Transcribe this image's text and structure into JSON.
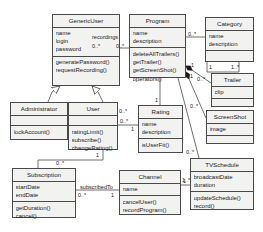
{
  "diagram": {
    "type": "uml-class-diagram",
    "background": "#ffffff",
    "box_fill": "#f2f2f0",
    "line_color": "#4a4a4a"
  },
  "classes": [
    {
      "id": "generic-user",
      "name": "GenericUser",
      "attributes": [
        "name",
        "login",
        "password"
      ],
      "operations": [
        "generatePassword()",
        "requestRecording()"
      ]
    },
    {
      "id": "program",
      "name": "Program",
      "attributes": [
        "name",
        "description"
      ],
      "operations": [
        "deleteAllTrailers()",
        "getTrailer()",
        "getScreenShot()",
        "operators()"
      ]
    },
    {
      "id": "category",
      "name": "Category",
      "attributes": [
        "name",
        "description"
      ],
      "operations": []
    },
    {
      "id": "trailer",
      "name": "Trailer",
      "attributes": [
        "clip"
      ],
      "operations": []
    },
    {
      "id": "screenshot",
      "name": "ScreenShot",
      "attributes": [
        "image"
      ],
      "operations": []
    },
    {
      "id": "administrator",
      "name": "Administrator",
      "attributes": [],
      "operations": [
        "lockAccount()"
      ]
    },
    {
      "id": "user",
      "name": "User",
      "attributes": [],
      "operations": [
        "ratingLimit()",
        "subscribe()",
        "changeRating()"
      ]
    },
    {
      "id": "rating",
      "name": "Rating",
      "attributes": [
        "name",
        "description"
      ],
      "operations": [
        "isUserFit()"
      ]
    },
    {
      "id": "tvschedule",
      "name": "TVSchedule",
      "attributes": [
        "broadcastDate",
        "duration"
      ],
      "operations": [
        "updateSchedule()",
        "record()"
      ]
    },
    {
      "id": "subscription",
      "name": "Subscription",
      "attributes": [
        "startDate",
        "endDate"
      ],
      "operations": [
        "getDuration()",
        "cancel()"
      ]
    },
    {
      "id": "channel",
      "name": "Channel",
      "attributes": [
        "name"
      ],
      "operations": [
        "cancelUser()",
        "recordProgram()"
      ]
    }
  ],
  "association_labels": [
    {
      "id": "recordings",
      "text": "recordings"
    },
    {
      "id": "subscribed-to",
      "text": "subscribedTo"
    }
  ],
  "multiplicities": [
    {
      "id": "genericuser-recordings-source",
      "text": "0..*"
    },
    {
      "id": "program-recordings-target",
      "text": "0..*"
    },
    {
      "id": "program-category-source",
      "text": "0..*"
    },
    {
      "id": "category-program-target",
      "text": "1"
    },
    {
      "id": "category-program-many",
      "text": "1..*"
    },
    {
      "id": "program-trailer-source",
      "text": "1"
    },
    {
      "id": "trailer-program-target",
      "text": "0..*"
    },
    {
      "id": "program-screenshot-source",
      "text": "1"
    },
    {
      "id": "screenshot-program-target",
      "text": "0..*"
    },
    {
      "id": "program-rating-source",
      "text": "1"
    },
    {
      "id": "rating-program-target",
      "text": "0..*"
    },
    {
      "id": "rating-user-target",
      "text": "1"
    },
    {
      "id": "program-tvschedule-source",
      "text": "0..*"
    },
    {
      "id": "tvschedule-channel-target",
      "text": "1..*"
    },
    {
      "id": "user-subscription-source",
      "text": "1"
    },
    {
      "id": "subscription-user-target",
      "text": "0..*"
    },
    {
      "id": "subscription-channel-source",
      "text": "0..*"
    },
    {
      "id": "channel-subscription-target",
      "text": "1"
    },
    {
      "id": "channel-tvschedule-source",
      "text": "1"
    },
    {
      "id": "user-channel-target",
      "text": "0..*"
    },
    {
      "id": "subscription-top",
      "text": "0..*"
    }
  ],
  "relationships": [
    {
      "id": "admin-inherits-genericuser",
      "type": "generalization",
      "from": "administrator",
      "to": "generic-user"
    },
    {
      "id": "user-inherits-genericuser",
      "type": "generalization",
      "from": "user",
      "to": "generic-user"
    },
    {
      "id": "genericuser-program",
      "type": "association",
      "from": "generic-user",
      "to": "program",
      "label": "recordings"
    },
    {
      "id": "program-category",
      "type": "association",
      "from": "program",
      "to": "category"
    },
    {
      "id": "program-trailer",
      "type": "composition",
      "from": "program",
      "to": "trailer"
    },
    {
      "id": "program-screenshot",
      "type": "composition",
      "from": "program",
      "to": "screenshot"
    },
    {
      "id": "program-rating",
      "type": "association",
      "from": "program",
      "to": "rating"
    },
    {
      "id": "program-tvschedule",
      "type": "association",
      "from": "program",
      "to": "tvschedule"
    },
    {
      "id": "rating-user",
      "type": "association",
      "from": "rating",
      "to": "user"
    },
    {
      "id": "user-subscription",
      "type": "association",
      "from": "user",
      "to": "subscription"
    },
    {
      "id": "subscription-channel",
      "type": "association",
      "from": "subscription",
      "to": "channel",
      "label": "subscribedTo"
    },
    {
      "id": "channel-tvschedule",
      "type": "association",
      "from": "channel",
      "to": "tvschedule"
    }
  ]
}
